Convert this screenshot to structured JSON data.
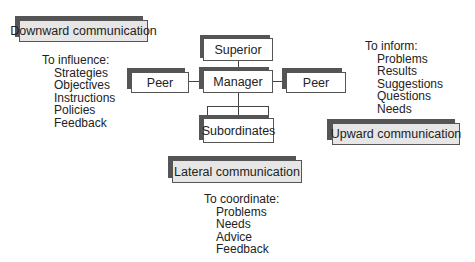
{
  "diagram": {
    "nodes": {
      "superior": "Superior",
      "manager": "Manager",
      "peer_left": "Peer",
      "peer_right": "Peer",
      "subordinates": "Subordinates"
    },
    "downward": {
      "label": "Downward communication",
      "heading": "To influence:",
      "items": [
        "Strategies",
        "Objectives",
        "Instructions",
        "Policies",
        "Feedback"
      ]
    },
    "upward": {
      "label": "Upward communication",
      "heading": "To inform:",
      "items": [
        "Problems",
        "Results",
        "Suggestions",
        "Questions",
        "Needs"
      ]
    },
    "lateral": {
      "label": "Lateral communication",
      "heading": "To coordinate:",
      "items": [
        "Problems",
        "Needs",
        "Advice",
        "Feedback"
      ]
    }
  }
}
